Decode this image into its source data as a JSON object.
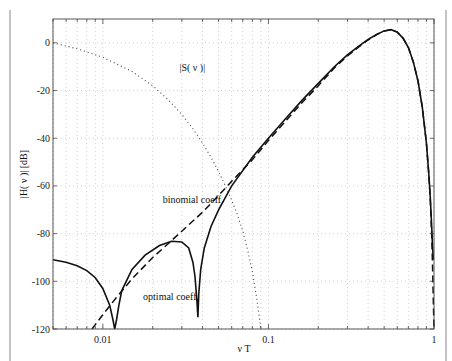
{
  "chart_data": {
    "type": "line",
    "title": "",
    "xlabel": "ν T",
    "ylabel": "|H( ν )| [dB]",
    "xscale": "log",
    "xlim": [
      0.005,
      1
    ],
    "ylim": [
      -120,
      10
    ],
    "grid": true,
    "xticks": [
      {
        "value": 0.01,
        "label": "0.01"
      },
      {
        "value": 0.1,
        "label": "0.1"
      },
      {
        "value": 1,
        "label": "1"
      }
    ],
    "yticks": [
      {
        "value": 0,
        "label": "0"
      },
      {
        "value": -20,
        "label": "-20"
      },
      {
        "value": -40,
        "label": "-40"
      },
      {
        "value": -60,
        "label": "-60"
      },
      {
        "value": -80,
        "label": "-80"
      },
      {
        "value": -100,
        "label": "-100"
      },
      {
        "value": -120,
        "label": "-120"
      }
    ],
    "series": [
      {
        "name": "optimal coeff.",
        "style": "solid",
        "x": [
          0.005,
          0.006,
          0.007,
          0.008,
          0.009,
          0.01,
          0.011,
          0.0115,
          0.0118,
          0.0121,
          0.0125,
          0.013,
          0.015,
          0.018,
          0.022,
          0.026,
          0.03,
          0.033,
          0.035,
          0.036,
          0.037,
          0.0375,
          0.038,
          0.039,
          0.041,
          0.045,
          0.05,
          0.06,
          0.08,
          0.1,
          0.13,
          0.16,
          0.2,
          0.25,
          0.3,
          0.35,
          0.4,
          0.45,
          0.5,
          0.55,
          0.6,
          0.65,
          0.7,
          0.75,
          0.8,
          0.85,
          0.9,
          0.93,
          0.95,
          0.97,
          0.98,
          0.99
        ],
        "y": [
          -91,
          -92,
          -93.5,
          -95.5,
          -98.5,
          -103,
          -110,
          -116,
          -120,
          -116,
          -110,
          -104,
          -95,
          -89,
          -85,
          -83.2,
          -83.5,
          -86,
          -92,
          -98,
          -108,
          -115,
          -105,
          -95,
          -86,
          -77,
          -70,
          -60,
          -48,
          -40,
          -31,
          -24,
          -17,
          -10,
          -5,
          -1.5,
          1.5,
          3.5,
          5,
          5.5,
          4.5,
          2,
          -2,
          -8,
          -16,
          -27,
          -42,
          -55,
          -65,
          -78,
          -85,
          -91
        ]
      },
      {
        "name": "binomial coeff.",
        "style": "dashed",
        "x": [
          0.0086,
          0.01,
          0.012,
          0.015,
          0.02,
          0.025,
          0.03,
          0.04,
          0.05,
          0.06,
          0.08,
          0.1,
          0.13,
          0.16,
          0.2,
          0.25,
          0.3,
          0.35,
          0.4,
          0.45,
          0.5,
          0.55,
          0.6,
          0.65,
          0.7,
          0.75,
          0.8,
          0.85,
          0.9,
          0.93,
          0.95,
          0.97,
          0.98,
          0.99,
          1.0
        ],
        "y": [
          -120,
          -114,
          -107,
          -99,
          -90,
          -84,
          -79,
          -71,
          -64,
          -58,
          -49,
          -41,
          -32,
          -25,
          -18,
          -10.5,
          -5.5,
          -1.8,
          1.2,
          3.4,
          5,
          5.5,
          4.5,
          2,
          -2,
          -8,
          -16,
          -27,
          -42,
          -55,
          -66,
          -82,
          -93,
          -108,
          -120
        ]
      },
      {
        "name": "|S( ν )|",
        "style": "dotted",
        "x": [
          0.005,
          0.007,
          0.01,
          0.015,
          0.02,
          0.025,
          0.03,
          0.035,
          0.04,
          0.045,
          0.05,
          0.055,
          0.06,
          0.065,
          0.07,
          0.075,
          0.08,
          0.085,
          0.09
        ],
        "y": [
          0,
          -2.5,
          -6,
          -12,
          -18,
          -24,
          -30,
          -36,
          -42,
          -48,
          -54,
          -60,
          -66,
          -72,
          -79,
          -87,
          -96,
          -107,
          -120
        ]
      }
    ],
    "annotations": [
      {
        "text": "|S( ν )|",
        "x": 0.029,
        "y": -12
      },
      {
        "text": "binomial coeff.",
        "x": 0.023,
        "y": -67
      },
      {
        "text": "optimal coeff.",
        "x": 0.0175,
        "y": -108
      }
    ]
  }
}
